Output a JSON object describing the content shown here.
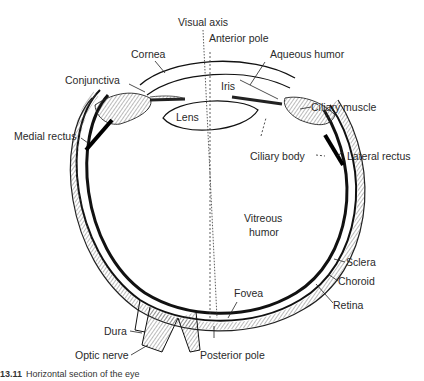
{
  "diagram": {
    "subject": "Horizontal section of the eye",
    "labels": {
      "visual_axis": "Visual axis",
      "anterior_pole": "Anterior pole",
      "cornea": "Cornea",
      "aqueous_humor": "Aqueous humor",
      "conjunctiva": "Conjunctiva",
      "iris": "Iris",
      "ciliary_muscle": "Ciliary muscle",
      "lens": "Lens",
      "medial_rectus": "Medial rectus",
      "ciliary_body": "Ciliary body",
      "lateral_rectus": "Lateral rectus",
      "vitreous_humor_1": "Vitreous",
      "vitreous_humor_2": "humor",
      "sclera": "Sclera",
      "choroid": "Choroid",
      "retina": "Retina",
      "fovea": "Fovea",
      "dura": "Dura",
      "optic_nerve": "Optic nerve",
      "posterior_pole": "Posterior pole"
    },
    "caption": {
      "number": "13.11",
      "text": "Horizontal section of the eye"
    }
  }
}
